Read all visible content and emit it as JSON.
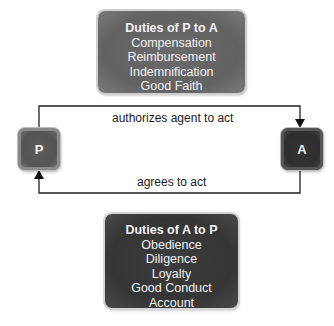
{
  "duties_p_to_a": {
    "title": "Duties of P to A",
    "items": [
      "Compensation",
      "Reimbursement",
      "Indemnification",
      "Good Faith"
    ]
  },
  "duties_a_to_p": {
    "title": "Duties of A to P",
    "items": [
      "Obedience",
      "Diligence",
      "Loyalty",
      "Good Conduct",
      "Account"
    ]
  },
  "parties": {
    "principal": "P",
    "agent": "A"
  },
  "arrows": {
    "top": "authorizes agent to act",
    "bottom": "agrees to act"
  },
  "colors": {
    "top_box": "#666666",
    "bottom_box": "#383838",
    "principal_box": "#5a5a5a",
    "agent_box": "#333333",
    "line": "#222222"
  }
}
